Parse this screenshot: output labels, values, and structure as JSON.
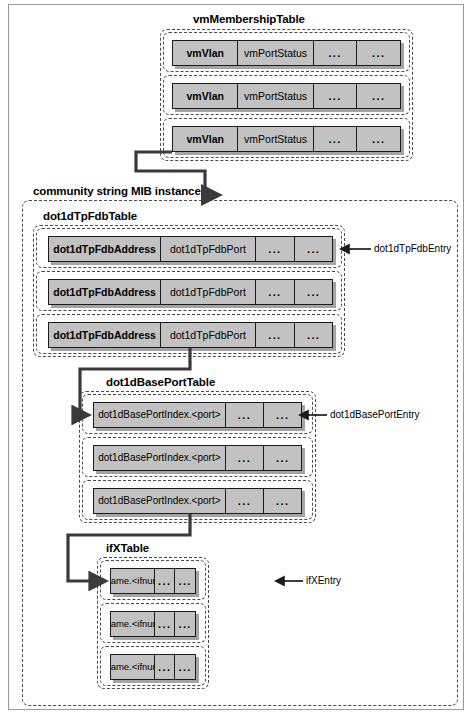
{
  "diagram": {
    "title_hidden": "",
    "colors": {
      "cell_fill": "#c2c2c2",
      "cell_border": "#1b1b1b",
      "dashed_border": "#4a4a4a",
      "page_frame": "#9a9a9a",
      "connector": "#3a3a3a"
    }
  },
  "vm_membership_table": {
    "label": "vmMembershipTable",
    "rows": [
      {
        "cells": [
          "vmVlan",
          "vmPortStatus",
          "...",
          "..."
        ]
      },
      {
        "cells": [
          "vmVlan",
          "vmPortStatus",
          "...",
          "..."
        ]
      },
      {
        "cells": [
          "vmVlan",
          "vmPortStatus",
          "...",
          "..."
        ]
      }
    ]
  },
  "community_instance": {
    "label": "community string MIB instance",
    "tables": [
      {
        "label": "dot1dTpFdbTable",
        "entry_label": "dot1dTpFdbEntry",
        "rows": [
          {
            "cells": [
              "dot1dTpFdbAddress",
              "dot1dTpFdbPort",
              "...",
              "..."
            ]
          },
          {
            "cells": [
              "dot1dTpFdbAddress",
              "dot1dTpFdbPort",
              "...",
              "..."
            ]
          },
          {
            "cells": [
              "dot1dTpFdbAddress",
              "dot1dTpFdbPort",
              "...",
              "..."
            ]
          }
        ]
      },
      {
        "label": "dot1dBasePortTable",
        "entry_label": "dot1dBasePortEntry",
        "rows": [
          {
            "cells": [
              "dot1dBasePortIndex.<port>",
              "...",
              "..."
            ]
          },
          {
            "cells": [
              "dot1dBasePortIndex.<port>",
              "...",
              "..."
            ]
          },
          {
            "cells": [
              "dot1dBasePortIndex.<port>",
              "...",
              "..."
            ]
          }
        ]
      },
      {
        "label": "ifXTable",
        "entry_label": "ifXEntry",
        "rows": [
          {
            "cells": [
              "ifName.<ifnum>",
              "...",
              "..."
            ]
          },
          {
            "cells": [
              "ifName.<ifnum>",
              "...",
              "..."
            ]
          },
          {
            "cells": [
              "ifName.<ifnum>",
              "...",
              "..."
            ]
          }
        ]
      }
    ]
  }
}
